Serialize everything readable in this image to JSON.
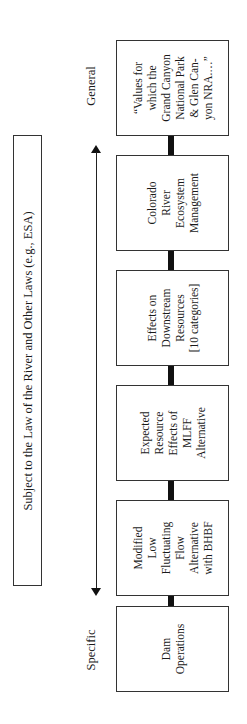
{
  "law_constraint": {
    "label": "Subject to the Law of the River and Other Laws (e.g., ESA)"
  },
  "axis": {
    "top_label": "General",
    "bottom_label": "Specific",
    "direction": "bidirectional"
  },
  "boxes": [
    {
      "id": "values",
      "lines": [
        "“Values for",
        "which the",
        "Grand Canyon",
        "National Park",
        "& Glen Can-",
        "yon NRA.…”"
      ]
    },
    {
      "id": "colorado",
      "lines": [
        "Colorado",
        "River",
        "Ecosystem",
        "Management"
      ]
    },
    {
      "id": "effects",
      "lines": [
        "Effects on",
        "Downstream",
        "Resources",
        "[10 categories]"
      ]
    },
    {
      "id": "expected",
      "lines": [
        "Expected",
        "Resource",
        "Effects of",
        "MLFF",
        "Alternative"
      ]
    },
    {
      "id": "modified",
      "lines": [
        "Modified",
        "Low",
        "Fluctuating",
        "Flow",
        "Alternative",
        "with BHBF"
      ]
    },
    {
      "id": "dam",
      "lines": [
        "Dam",
        "Operations"
      ]
    }
  ]
}
